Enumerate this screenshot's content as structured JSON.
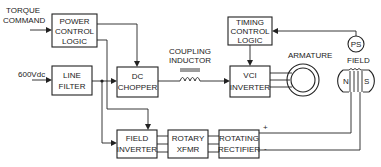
{
  "diagram": {
    "inputs": {
      "torque_command_line1": "TORQUE",
      "torque_command_line2": "COMMAND",
      "dc_supply": "600Vdc"
    },
    "blocks": {
      "power_control_logic": [
        "POWER",
        "CONTROL",
        "LOGIC"
      ],
      "line_filter": [
        "LINE",
        "FILTER"
      ],
      "dc_chopper": [
        "DC",
        "CHOPPER"
      ],
      "timing_control_logic": [
        "TIMING",
        "CONTROL",
        "LOGIC"
      ],
      "vci_inverter": [
        "VCI",
        "INVERTER"
      ],
      "field_inverter": [
        "FIELD",
        "INVERTER"
      ],
      "rotary_xfmr": [
        "ROTARY",
        "XFMR"
      ],
      "rotating_rectifier": [
        "ROTATING",
        "RECTIFIER"
      ]
    },
    "labels": {
      "coupling_inductor_line1": "COUPLING",
      "coupling_inductor_line2": "INDUCTOR",
      "armature": "ARMATURE",
      "field": "FIELD",
      "ps": "PS",
      "north": "N",
      "south": "S",
      "plus": "+",
      "minus": "-"
    },
    "colors": {
      "line": "#222222",
      "background": "#ffffff"
    }
  }
}
